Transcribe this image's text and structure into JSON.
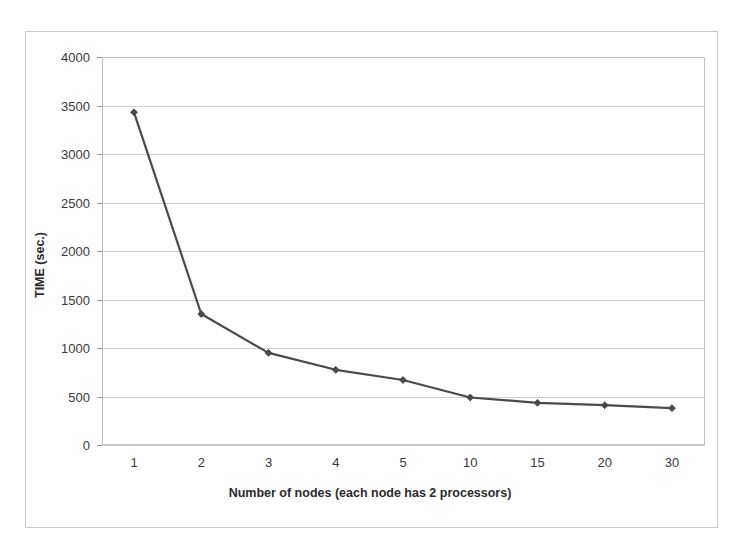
{
  "figure": {
    "background_color": "#ffffff",
    "border_color": "#c9c9c9",
    "plot_border_color": "#c2c2c2",
    "gridline_color": "#cfcfcf"
  },
  "chart_data": {
    "type": "line",
    "title": "",
    "xlabel": "Number of nodes (each node has 2 processors)",
    "ylabel": "TIME (sec.)",
    "categories": [
      "1",
      "2",
      "3",
      "4",
      "5",
      "10",
      "15",
      "20",
      "30"
    ],
    "values": [
      3430,
      1350,
      950,
      775,
      670,
      490,
      435,
      410,
      380
    ],
    "series": [
      {
        "name": "TIME (sec.)",
        "color": "#4a4a4a",
        "marker": "diamond",
        "values": [
          3430,
          1350,
          950,
          775,
          670,
          490,
          435,
          410,
          380
        ]
      }
    ],
    "ylim": [
      0,
      4000
    ],
    "ytick_step": 500,
    "yticks": [
      0,
      500,
      1000,
      1500,
      2000,
      2500,
      3000,
      3500,
      4000
    ],
    "ytick_labels": [
      "0",
      "500",
      "1000",
      "1500",
      "2000",
      "2500",
      "3000",
      "3500",
      "4000"
    ],
    "grid": true,
    "grid_axis": "y",
    "legend": false,
    "legend_position": "none"
  }
}
